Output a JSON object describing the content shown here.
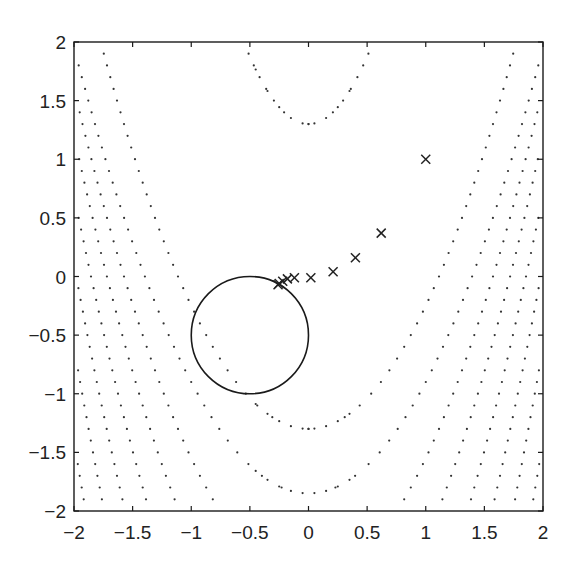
{
  "chart_data": {
    "type": "scatter",
    "title": "",
    "xlabel": "",
    "ylabel": "",
    "xlim": [
      -2,
      2
    ],
    "ylim": [
      -2,
      2
    ],
    "grid": false,
    "legend": null,
    "x_ticks": [
      -2,
      -1.5,
      -1,
      -0.5,
      0,
      0.5,
      1,
      1.5,
      2
    ],
    "x_tick_labels": [
      "−2",
      "−1.5",
      "−1",
      "−0.5",
      "0",
      "0.5",
      "1",
      "1.5",
      "2"
    ],
    "y_ticks": [
      2,
      1.5,
      1,
      0.5,
      0,
      -0.5,
      -1,
      -1.5,
      -2
    ],
    "y_tick_labels": [
      "2",
      "1.5",
      "1",
      "0.5",
      "0",
      "−0.5",
      "−1",
      "−1.5",
      "−2"
    ],
    "constraint_circle": {
      "center": [
        -0.5,
        -0.5
      ],
      "radius": 0.5,
      "style": "solid"
    },
    "iterates": {
      "marker": "x",
      "points": [
        [
          1.0,
          1.0
        ],
        [
          0.62,
          0.37
        ],
        [
          0.4,
          0.16
        ],
        [
          0.21,
          0.04
        ],
        [
          0.02,
          -0.01
        ],
        [
          -0.12,
          -0.01
        ],
        [
          -0.18,
          -0.02
        ],
        [
          -0.22,
          -0.04
        ],
        [
          -0.25,
          -0.06
        ],
        [
          -0.26,
          -0.07
        ]
      ]
    },
    "contours": {
      "style": "dotted",
      "description": "Level curves of a banana-shaped objective, symmetric about x=0",
      "curves": [
        {
          "vertex_y": 1.3,
          "curvature": 2.3
        },
        {
          "vertex_y": -1.3,
          "curvature": 1.05
        },
        {
          "vertex_y": -1.85,
          "curvature": 0.95
        },
        {
          "vertex_y": -2.6,
          "curvature": 1.05
        },
        {
          "vertex_y": -3.4,
          "curvature": 1.15
        },
        {
          "vertex_y": -4.3,
          "curvature": 1.25
        },
        {
          "vertex_y": -5.3,
          "curvature": 1.35
        },
        {
          "vertex_y": -6.4,
          "curvature": 1.45
        },
        {
          "vertex_y": -7.6,
          "curvature": 1.55
        },
        {
          "vertex_y": -8.9,
          "curvature": 1.65
        },
        {
          "vertex_y": -10.3,
          "curvature": 1.75
        },
        {
          "vertex_y": -11.8,
          "curvature": 1.85
        },
        {
          "vertex_y": -13.4,
          "curvature": 1.95
        },
        {
          "vertex_y": -15.1,
          "curvature": 2.05
        },
        {
          "vertex_y": -16.9,
          "curvature": 2.15
        },
        {
          "vertex_y": -18.8,
          "curvature": 2.25
        },
        {
          "vertex_y": -20.8,
          "curvature": 2.35
        },
        {
          "vertex_y": -22.9,
          "curvature": 2.45
        },
        {
          "vertex_y": -25.1,
          "curvature": 2.55
        }
      ],
      "sample_dy": 0.1
    }
  },
  "colors": {
    "axes": "#1a1a1a",
    "dots": "#333333",
    "circle": "#1a1a1a",
    "markers": "#222222",
    "background": "#ffffff"
  }
}
